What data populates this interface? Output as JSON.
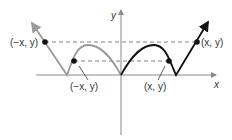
{
  "diagram": {
    "type": "even-function-symmetry",
    "axes": {
      "x_label": "x",
      "y_label": "y"
    },
    "points": {
      "outer_left": "(−x, y)",
      "outer_right": "(x, y)",
      "inner_left": "(−x, y)",
      "inner_right": "(x, y)"
    },
    "colors": {
      "left_curve": "#9a9a9a",
      "right_curve": "#111111",
      "axes": "#888888",
      "dashed": "#777777",
      "points": "#111111"
    }
  }
}
